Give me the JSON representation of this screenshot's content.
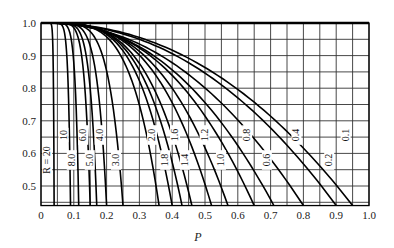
{
  "chart_data": {
    "type": "line",
    "title": "",
    "xlabel": "P",
    "ylabel": "",
    "xlim": [
      0,
      1.0
    ],
    "ylim": [
      0.44,
      1.0
    ],
    "grid": true,
    "grid_step": 0.05,
    "x_ticks": [
      "0",
      "0.1",
      "0.2",
      "0.3",
      "0.4",
      "0.5",
      "0.6",
      "0.7",
      "0.8",
      "0.9",
      "1.0"
    ],
    "y_ticks": [
      "0.5",
      "0.6",
      "0.7",
      "0.8",
      "0.9",
      "1.0"
    ],
    "legend": "none (curves labeled inline)",
    "series": [
      {
        "name": "R = 20",
        "label": "R = 20",
        "p_at_bottom": 0.04,
        "p_knee": 0.0
      },
      {
        "name": "10",
        "label": "10",
        "p_at_bottom": 0.09,
        "p_knee": 0.02
      },
      {
        "name": "8.0",
        "label": "8.0",
        "p_at_bottom": 0.115,
        "p_knee": 0.03
      },
      {
        "name": "6.0",
        "label": "6.0",
        "p_at_bottom": 0.15,
        "p_knee": 0.04
      },
      {
        "name": "5.0",
        "label": "5.0",
        "p_at_bottom": 0.17,
        "p_knee": 0.05
      },
      {
        "name": "4.0",
        "label": "4.0",
        "p_at_bottom": 0.2,
        "p_knee": 0.06
      },
      {
        "name": "3.0",
        "label": "3.0",
        "p_at_bottom": 0.25,
        "p_knee": 0.08
      },
      {
        "name": "2.0",
        "label": "2.0",
        "p_at_bottom": 0.36,
        "p_knee": 0.11
      },
      {
        "name": "1.8",
        "label": "1.8",
        "p_at_bottom": 0.4,
        "p_knee": 0.12
      },
      {
        "name": "1.6",
        "label": "1.6",
        "p_at_bottom": 0.43,
        "p_knee": 0.14
      },
      {
        "name": "1.4",
        "label": "1.4",
        "p_at_bottom": 0.46,
        "p_knee": 0.16
      },
      {
        "name": "1.2",
        "label": "1.2",
        "p_at_bottom": 0.52,
        "p_knee": 0.18
      },
      {
        "name": "1.0",
        "label": "1.0",
        "p_at_bottom": 0.57,
        "p_knee": 0.2
      },
      {
        "name": "0.8",
        "label": "0.8",
        "p_at_bottom": 0.65,
        "p_knee": 0.24
      },
      {
        "name": "0.6",
        "label": "0.6",
        "p_at_bottom": 0.71,
        "p_knee": 0.28
      },
      {
        "name": "0.4",
        "label": "0.4",
        "p_at_bottom": 0.8,
        "p_knee": 0.34
      },
      {
        "name": "0.2",
        "label": "0.2",
        "p_at_bottom": 0.9,
        "p_knee": 0.45
      },
      {
        "name": "0.1",
        "label": "0.1",
        "p_at_bottom": 0.95,
        "p_knee": 0.55
      }
    ]
  }
}
